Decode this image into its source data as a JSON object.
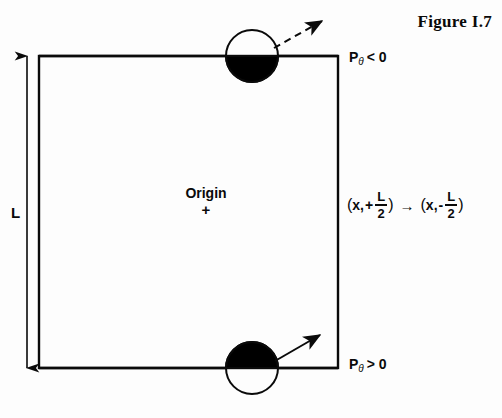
{
  "figure": {
    "caption": "Figure I.7"
  },
  "diagram": {
    "type": "schematic",
    "box": {
      "x": 39,
      "y": 56,
      "width": 299,
      "height": 312,
      "stroke": "#0a0a0a",
      "stroke_width": 2.4
    },
    "dimension": {
      "label": "L",
      "axis": "vertical",
      "x": 27,
      "y_top": 52,
      "y_bottom": 372,
      "stroke": "#0a0a0a"
    },
    "origin": {
      "label": "Origin",
      "marker": "+",
      "x": 206,
      "y": 212
    },
    "particles": [
      {
        "name": "top-particle",
        "cx": 252,
        "cy": 56,
        "r": 26,
        "upper_half": "white",
        "lower_half": "black",
        "fill": "#000000",
        "stroke": "#0a0a0a"
      },
      {
        "name": "bottom-particle",
        "cx": 252,
        "cy": 368,
        "r": 26,
        "upper_half": "black",
        "lower_half": "white",
        "fill": "#000000",
        "stroke": "#0a0a0a"
      }
    ],
    "momentum_arrows": [
      {
        "name": "top-momentum-arrow",
        "style": "dashed",
        "x1": 274,
        "y1": 48,
        "x2": 326,
        "y2": 19,
        "stroke": "#0a0a0a"
      },
      {
        "name": "bottom-momentum-arrow",
        "style": "solid",
        "x1": 275,
        "y1": 361,
        "x2": 324,
        "y2": 333,
        "stroke": "#0a0a0a"
      }
    ]
  },
  "labels": {
    "dimension_L": "L",
    "origin_text": "Origin",
    "origin_cross": "+",
    "p_theta_top": {
      "symbol": "P",
      "subscript": "θ",
      "relation": "< 0"
    },
    "p_theta_bottom": {
      "symbol": "P",
      "subscript": "θ",
      "relation": "> 0"
    }
  },
  "mapping": {
    "left_open": "(",
    "left_var": "x,",
    "left_sign": "+",
    "numerator": "L",
    "denominator": "2",
    "left_close": ")",
    "arrow": "→",
    "right_open": "(",
    "right_var": "x,",
    "right_sign": "-",
    "right_numerator": "L",
    "right_denominator": "2",
    "right_close": ")",
    "plain_text": "(x, +L/2) → (x, -L/2)"
  },
  "colors": {
    "ink": "#0a0a0a",
    "fill": "#000000",
    "background": "#fdfdfd"
  }
}
